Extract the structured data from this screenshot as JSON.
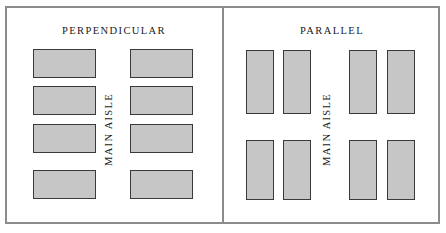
{
  "figure": {
    "width": 446,
    "height": 233,
    "background_color": "#ffffff",
    "frame_color": "#8c8c8c",
    "stall_fill_color": "#c6c6c6",
    "stall_border_color": "#3a3a3a"
  },
  "panels": [
    {
      "id": "perpendicular",
      "title": "PERPENDICULAR",
      "aisle_label": "MAIN AISLE",
      "stall_orientation": "horizontal",
      "stall_count": 8,
      "columns": 2,
      "rows": 4,
      "stalls": [
        {
          "x": 33,
          "y": 49,
          "w": 63,
          "h": 29
        },
        {
          "x": 33,
          "y": 86,
          "w": 63,
          "h": 29
        },
        {
          "x": 33,
          "y": 124,
          "w": 63,
          "h": 29
        },
        {
          "x": 33,
          "y": 170,
          "w": 63,
          "h": 29
        },
        {
          "x": 130,
          "y": 49,
          "w": 63,
          "h": 29
        },
        {
          "x": 130,
          "y": 86,
          "w": 63,
          "h": 29
        },
        {
          "x": 130,
          "y": 124,
          "w": 63,
          "h": 29
        },
        {
          "x": 130,
          "y": 170,
          "w": 63,
          "h": 29
        }
      ]
    },
    {
      "id": "parallel",
      "title": "PARALLEL",
      "aisle_label": "MAIN AISLE",
      "stall_orientation": "vertical",
      "stall_count": 8,
      "columns": 4,
      "rows": 2,
      "stalls": [
        {
          "x": 246,
          "y": 50,
          "w": 28,
          "h": 64
        },
        {
          "x": 283,
          "y": 50,
          "w": 28,
          "h": 64
        },
        {
          "x": 349,
          "y": 50,
          "w": 28,
          "h": 64
        },
        {
          "x": 387,
          "y": 50,
          "w": 28,
          "h": 64
        },
        {
          "x": 246,
          "y": 140,
          "w": 28,
          "h": 60
        },
        {
          "x": 283,
          "y": 140,
          "w": 28,
          "h": 60
        },
        {
          "x": 349,
          "y": 140,
          "w": 28,
          "h": 60
        },
        {
          "x": 387,
          "y": 140,
          "w": 28,
          "h": 60
        }
      ]
    }
  ]
}
